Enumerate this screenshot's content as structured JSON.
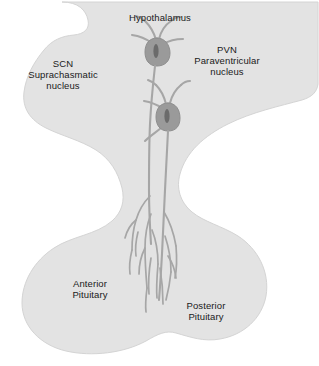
{
  "figure": {
    "background_color": "#ffffff",
    "tissue_fill_color": "#e3e3e3",
    "tissue_edge_color": "#d2d2d2",
    "neuron_stroke_color": "#a6a6a6",
    "soma_fill_color": "#9a9a9a",
    "nucleus_fill_color": "#6e6e6e",
    "label_color": "#1a1a1a"
  },
  "labels": {
    "hypothalamus": "Hypothalamus",
    "scn_abbrev": "SCN",
    "scn_line1": "Suprachasmatic",
    "scn_line2": "nucleus",
    "pvn_abbrev": "PVN",
    "pvn_line1": "Paraventricular",
    "pvn_line2": "nucleus",
    "anterior_line1": "Anterior",
    "anterior_line2": "Pituitary",
    "posterior_line1": "Posterior",
    "posterior_line2": "Pituitary"
  }
}
